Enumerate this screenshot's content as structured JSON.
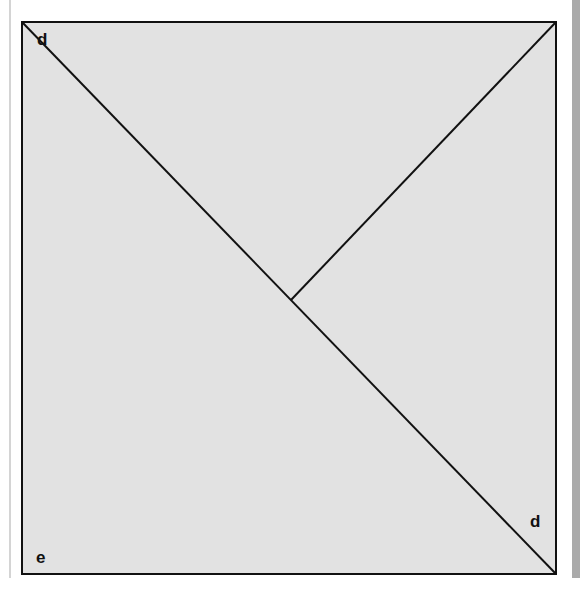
{
  "figure": {
    "type": "geometry-square-with-diagonal",
    "square": {
      "x": 22,
      "y": 22,
      "width": 534,
      "height": 552
    },
    "fill_color": "#e2e2e2",
    "stroke_color": "#111111",
    "diagonal": {
      "from": [
        22,
        22
      ],
      "to": [
        556,
        574
      ]
    },
    "segment": {
      "from": [
        556,
        22
      ],
      "to": [
        291,
        300
      ]
    },
    "labels": [
      {
        "id": "top-left",
        "text": "d",
        "x": 37,
        "y": 45
      },
      {
        "id": "bottom-right",
        "text": "d",
        "x": 530,
        "y": 527
      },
      {
        "id": "bottom-left",
        "text": "e",
        "x": 36,
        "y": 563
      }
    ]
  }
}
